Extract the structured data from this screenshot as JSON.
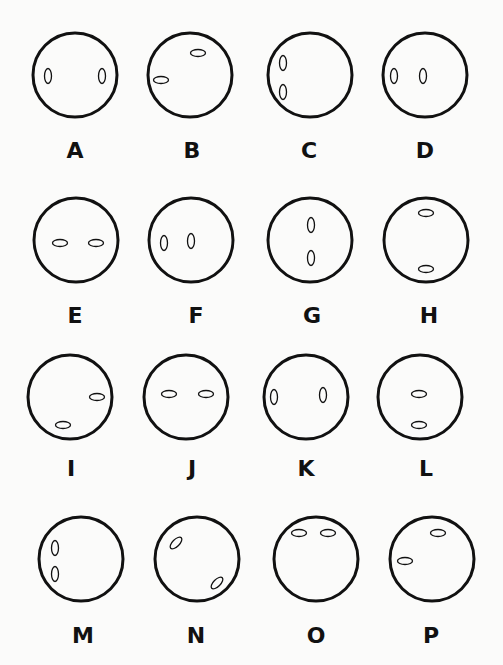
{
  "figure": {
    "background": "#fbfbfa",
    "stroke_color": "#111111",
    "options": [
      {
        "label": "A",
        "cx": 75,
        "cy": 75,
        "r": 42,
        "eyes": [
          {
            "cx": 48,
            "cy": 76,
            "rx": 3.5,
            "ry": 7.5,
            "rot": 0
          },
          {
            "cx": 102,
            "cy": 76,
            "rx": 3.5,
            "ry": 7.5,
            "rot": 0
          }
        ],
        "lx": 75,
        "ly": 158
      },
      {
        "label": "B",
        "cx": 190,
        "cy": 75,
        "r": 42,
        "eyes": [
          {
            "cx": 198,
            "cy": 53,
            "rx": 7.5,
            "ry": 3.5,
            "rot": 0
          },
          {
            "cx": 161,
            "cy": 80,
            "rx": 7.5,
            "ry": 3.5,
            "rot": 0
          }
        ],
        "lx": 192,
        "ly": 158
      },
      {
        "label": "C",
        "cx": 310,
        "cy": 75,
        "r": 42,
        "eyes": [
          {
            "cx": 283,
            "cy": 63,
            "rx": 3.5,
            "ry": 7.5,
            "rot": 0
          },
          {
            "cx": 283,
            "cy": 92,
            "rx": 3.5,
            "ry": 7.5,
            "rot": 0
          }
        ],
        "lx": 309,
        "ly": 158
      },
      {
        "label": "D",
        "cx": 425,
        "cy": 75,
        "r": 42,
        "eyes": [
          {
            "cx": 394,
            "cy": 76,
            "rx": 3.5,
            "ry": 7.5,
            "rot": 0
          },
          {
            "cx": 423,
            "cy": 76,
            "rx": 3.5,
            "ry": 7.5,
            "rot": 0
          }
        ],
        "lx": 425,
        "ly": 158
      },
      {
        "label": "E",
        "cx": 76,
        "cy": 240,
        "r": 42,
        "eyes": [
          {
            "cx": 60,
            "cy": 243,
            "rx": 7.5,
            "ry": 3.5,
            "rot": 0
          },
          {
            "cx": 96,
            "cy": 243,
            "rx": 7.5,
            "ry": 3.5,
            "rot": 0
          }
        ],
        "lx": 75,
        "ly": 323
      },
      {
        "label": "F",
        "cx": 191,
        "cy": 240,
        "r": 42,
        "eyes": [
          {
            "cx": 164,
            "cy": 243,
            "rx": 3.5,
            "ry": 7.5,
            "rot": 0
          },
          {
            "cx": 191,
            "cy": 241,
            "rx": 3.5,
            "ry": 7.5,
            "rot": 0
          }
        ],
        "lx": 196,
        "ly": 323
      },
      {
        "label": "G",
        "cx": 310,
        "cy": 240,
        "r": 42,
        "eyes": [
          {
            "cx": 311,
            "cy": 225,
            "rx": 3.5,
            "ry": 7.5,
            "rot": 0
          },
          {
            "cx": 311,
            "cy": 258,
            "rx": 3.5,
            "ry": 7.5,
            "rot": 0
          }
        ],
        "lx": 312,
        "ly": 323
      },
      {
        "label": "H",
        "cx": 426,
        "cy": 240,
        "r": 42,
        "eyes": [
          {
            "cx": 426,
            "cy": 213,
            "rx": 7.5,
            "ry": 3.5,
            "rot": 0
          },
          {
            "cx": 426,
            "cy": 269,
            "rx": 7.5,
            "ry": 3.5,
            "rot": 0
          }
        ],
        "lx": 429,
        "ly": 323
      },
      {
        "label": "I",
        "cx": 70,
        "cy": 397,
        "r": 42,
        "eyes": [
          {
            "cx": 97,
            "cy": 397,
            "rx": 7.5,
            "ry": 3.5,
            "rot": 0
          },
          {
            "cx": 63,
            "cy": 425,
            "rx": 7.5,
            "ry": 3.5,
            "rot": 0
          }
        ],
        "lx": 71,
        "ly": 476
      },
      {
        "label": "J",
        "cx": 186,
        "cy": 397,
        "r": 42,
        "eyes": [
          {
            "cx": 169,
            "cy": 394,
            "rx": 7.5,
            "ry": 3.5,
            "rot": 0
          },
          {
            "cx": 206,
            "cy": 394,
            "rx": 7.5,
            "ry": 3.5,
            "rot": 0
          }
        ],
        "lx": 192,
        "ly": 476
      },
      {
        "label": "K",
        "cx": 306,
        "cy": 397,
        "r": 42,
        "eyes": [
          {
            "cx": 274,
            "cy": 397,
            "rx": 3.5,
            "ry": 7.5,
            "rot": 0
          },
          {
            "cx": 323,
            "cy": 395,
            "rx": 3.5,
            "ry": 7.5,
            "rot": 0
          }
        ],
        "lx": 306,
        "ly": 476
      },
      {
        "label": "L",
        "cx": 420,
        "cy": 397,
        "r": 42,
        "eyes": [
          {
            "cx": 419,
            "cy": 394,
            "rx": 7.5,
            "ry": 3.5,
            "rot": 0
          },
          {
            "cx": 419,
            "cy": 425,
            "rx": 7.5,
            "ry": 3.5,
            "rot": 0
          }
        ],
        "lx": 426,
        "ly": 476
      },
      {
        "label": "M",
        "cx": 81,
        "cy": 559,
        "r": 42,
        "eyes": [
          {
            "cx": 55,
            "cy": 548,
            "rx": 3.5,
            "ry": 7.5,
            "rot": 0
          },
          {
            "cx": 55,
            "cy": 574,
            "rx": 3.5,
            "ry": 7.5,
            "rot": 0
          }
        ],
        "lx": 83,
        "ly": 643
      },
      {
        "label": "N",
        "cx": 197,
        "cy": 559,
        "r": 42,
        "eyes": [
          {
            "cx": 176,
            "cy": 543,
            "rx": 7.5,
            "ry": 3.5,
            "rot": -45
          },
          {
            "cx": 217,
            "cy": 583,
            "rx": 7.5,
            "ry": 3.5,
            "rot": -45
          }
        ],
        "lx": 196,
        "ly": 643
      },
      {
        "label": "O",
        "cx": 316,
        "cy": 559,
        "r": 42,
        "eyes": [
          {
            "cx": 299,
            "cy": 533,
            "rx": 7.5,
            "ry": 3.5,
            "rot": 0
          },
          {
            "cx": 328,
            "cy": 533,
            "rx": 7.5,
            "ry": 3.5,
            "rot": 0
          }
        ],
        "lx": 316,
        "ly": 643
      },
      {
        "label": "P",
        "cx": 432,
        "cy": 559,
        "r": 42,
        "eyes": [
          {
            "cx": 438,
            "cy": 533,
            "rx": 7.5,
            "ry": 3.5,
            "rot": 0
          },
          {
            "cx": 405,
            "cy": 561,
            "rx": 7.5,
            "ry": 3.5,
            "rot": 0
          }
        ],
        "lx": 431,
        "ly": 643
      }
    ]
  }
}
